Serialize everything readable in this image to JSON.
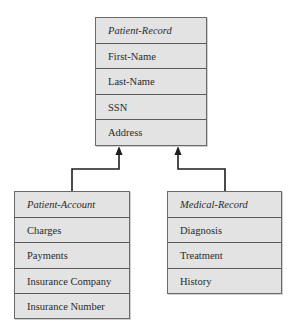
{
  "diagram": {
    "type": "class-inheritance",
    "classes": [
      {
        "id": "patient-record",
        "name": "Patient-Record",
        "attributes": [
          "First-Name",
          "Last-Name",
          "SSN",
          "Address"
        ]
      },
      {
        "id": "patient-account",
        "name": "Patient-Account",
        "attributes": [
          "Charges",
          "Payments",
          "Insurance Company",
          "Insurance Number"
        ]
      },
      {
        "id": "medical-record",
        "name": "Medical-Record",
        "attributes": [
          "Diagnosis",
          "Treatment",
          "History"
        ]
      }
    ],
    "relationships": [
      {
        "from": "Patient-Account",
        "to": "Patient-Record",
        "type": "inheritance"
      },
      {
        "from": "Medical-Record",
        "to": "Patient-Record",
        "type": "inheritance"
      }
    ],
    "caption": "Figure: Patient class inheritance"
  }
}
